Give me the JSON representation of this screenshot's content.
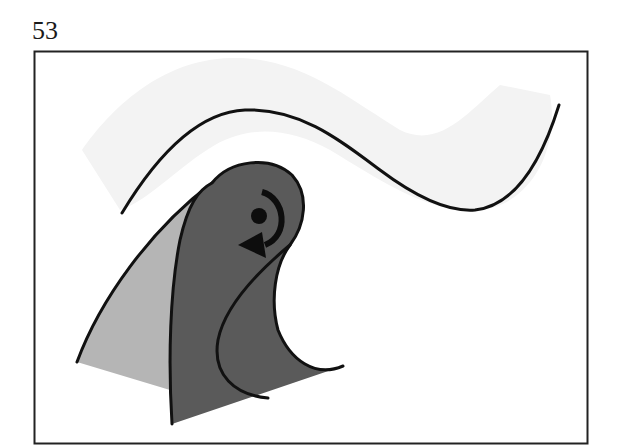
{
  "page": {
    "number": "53"
  },
  "figure": {
    "frame": {
      "x": 34,
      "y": 51,
      "width": 553,
      "height": 392,
      "stroke": "#222222"
    },
    "colors": {
      "wave_band": "#f3f3f3",
      "wave_line": "#111111",
      "light_fin": "#b5b5b5",
      "dark_fin": "#5a5a5a",
      "outline": "#111111",
      "rotation_marker": "#0d0d0d"
    },
    "elements": [
      {
        "id": "wave-band",
        "description": "faint light-grey wavy band behind the curve"
      },
      {
        "id": "wave-curve",
        "description": "black S-shaped wave line"
      },
      {
        "id": "light-fin",
        "description": "light grey fin/blade shape"
      },
      {
        "id": "dark-fin",
        "description": "dark grey fin/blade shape with curled tip"
      },
      {
        "id": "rotation-marker",
        "description": "dot with clockwise curved arrow indicating rotation"
      }
    ]
  }
}
